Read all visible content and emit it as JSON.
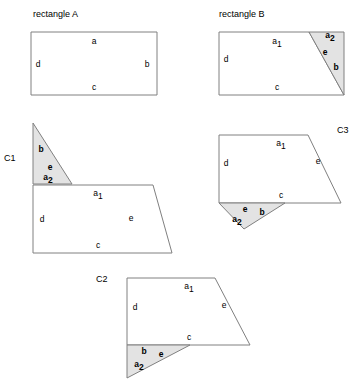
{
  "figure": {
    "background_color": "#ffffff",
    "outline_color": "#808080",
    "shaded_fill_color": "#e3e3e3",
    "text_color": "#000000",
    "width": 359,
    "height": 386
  },
  "captions": {
    "rectangle_a": "rectangle A",
    "rectangle_b": "rectangle B",
    "c1": "C1",
    "c2": "C2",
    "c3": "C3"
  },
  "edge_labels": {
    "a": "a",
    "a1_base": "a",
    "a1_sub": "1",
    "a2_base": "a",
    "a2_sub": "2",
    "b": "b",
    "c": "c",
    "d": "d",
    "e": "e"
  },
  "panels": [
    {
      "id": "rectangle-a",
      "caption": "rectangle A",
      "caption_pos": [
        33,
        17
      ],
      "shapes": [
        {
          "name": "rectangle-a-outline",
          "kind": "outline",
          "points": "31,32 157,32 157,95 31,95"
        }
      ],
      "labels": [
        {
          "name": "label-a",
          "text_key": "a",
          "pos": [
            94,
            44
          ]
        },
        {
          "name": "label-b",
          "text_key": "b",
          "pos": [
            147,
            67
          ]
        },
        {
          "name": "label-c",
          "text_key": "c",
          "pos": [
            94,
            90
          ]
        },
        {
          "name": "label-d",
          "text_key": "d",
          "pos": [
            38,
            67
          ]
        }
      ]
    },
    {
      "id": "rectangle-b",
      "caption": "rectangle B",
      "caption_pos": [
        219,
        17
      ],
      "shapes": [
        {
          "name": "rectangle-b-quadrilateral",
          "kind": "outline",
          "points": "219,32 309,32 344,95 219,95"
        },
        {
          "name": "rectangle-b-triangle",
          "kind": "shaded",
          "points": "309,32 344,32 344,95"
        }
      ],
      "labels": [
        {
          "name": "label-a1",
          "text_key": "a1",
          "pos": [
            277,
            44
          ]
        },
        {
          "name": "label-a2",
          "text_key": "a2",
          "pos": [
            330,
            38
          ]
        },
        {
          "name": "label-b",
          "text_key": "b",
          "pos": [
            336,
            70
          ]
        },
        {
          "name": "label-c",
          "text_key": "c",
          "pos": [
            277,
            90
          ]
        },
        {
          "name": "label-d",
          "text_key": "d",
          "pos": [
            226,
            62
          ]
        },
        {
          "name": "label-e",
          "text_key": "e",
          "pos": [
            325,
            55
          ]
        }
      ]
    },
    {
      "id": "c1",
      "caption": "C1",
      "caption_pos": [
        4,
        161
      ],
      "shapes": [
        {
          "name": "c1-quadrilateral",
          "kind": "outline",
          "points": "33,185 153,185 172,253 33,253"
        },
        {
          "name": "c1-triangle",
          "kind": "shaded",
          "points": "33,123 72,184 33,184"
        }
      ],
      "labels": [
        {
          "name": "label-b",
          "text_key": "b",
          "pos": [
            41,
            152
          ]
        },
        {
          "name": "label-e-triangle",
          "text_key": "e",
          "pos": [
            50,
            170
          ]
        },
        {
          "name": "label-a2",
          "text_key": "a2",
          "pos": [
            48,
            180
          ]
        },
        {
          "name": "label-a1",
          "text_key": "a1",
          "pos": [
            98,
            196
          ]
        },
        {
          "name": "label-d",
          "text_key": "d",
          "pos": [
            42,
            222
          ]
        },
        {
          "name": "label-e",
          "text_key": "e",
          "pos": [
            131,
            221
          ]
        },
        {
          "name": "label-c",
          "text_key": "c",
          "pos": [
            98,
            248
          ]
        }
      ]
    },
    {
      "id": "c3",
      "caption": "C3",
      "caption_pos": [
        337,
        133
      ]
    },
    {
      "id": "c2",
      "caption": "C2",
      "caption_pos": [
        96,
        282
      ]
    }
  ],
  "c3": {
    "shapes": [
      {
        "name": "c3-quadrilateral",
        "kind": "outline",
        "points": "219,135 308,135 341,203 219,203"
      },
      {
        "name": "c3-triangle",
        "kind": "shaded",
        "points": "219,203 285,203 244,229"
      }
    ],
    "labels": [
      {
        "name": "label-a1",
        "text_key": "a1",
        "pos": [
          281,
          146
        ]
      },
      {
        "name": "label-d",
        "text_key": "d",
        "pos": [
          226,
          166
        ]
      },
      {
        "name": "label-e-right",
        "text_key": "e",
        "pos": [
          318,
          164
        ]
      },
      {
        "name": "label-c",
        "text_key": "c",
        "pos": [
          281,
          198
        ]
      },
      {
        "name": "label-e-triangle",
        "text_key": "e",
        "pos": [
          245,
          212
        ]
      },
      {
        "name": "label-b",
        "text_key": "b",
        "pos": [
          262,
          215
        ]
      },
      {
        "name": "label-a2",
        "text_key": "a2",
        "pos": [
          237,
          222
        ]
      }
    ]
  },
  "c2": {
    "shapes": [
      {
        "name": "c2-quadrilateral",
        "kind": "outline",
        "points": "127,278 215,278 250,345 127,345"
      },
      {
        "name": "c2-triangle",
        "kind": "shaded",
        "points": "127,345 190,345 127,378"
      }
    ],
    "labels": [
      {
        "name": "label-a1",
        "text_key": "a1",
        "pos": [
          189,
          289
        ]
      },
      {
        "name": "label-d",
        "text_key": "d",
        "pos": [
          135,
          310
        ]
      },
      {
        "name": "label-e-right",
        "text_key": "e",
        "pos": [
          224,
          308
        ]
      },
      {
        "name": "label-c",
        "text_key": "c",
        "pos": [
          189,
          340
        ]
      },
      {
        "name": "label-b",
        "text_key": "b",
        "pos": [
          144,
          354
        ]
      },
      {
        "name": "label-e-triangle",
        "text_key": "e",
        "pos": [
          161,
          357
        ]
      },
      {
        "name": "label-a2",
        "text_key": "a2",
        "pos": [
          139,
          367
        ]
      }
    ]
  }
}
